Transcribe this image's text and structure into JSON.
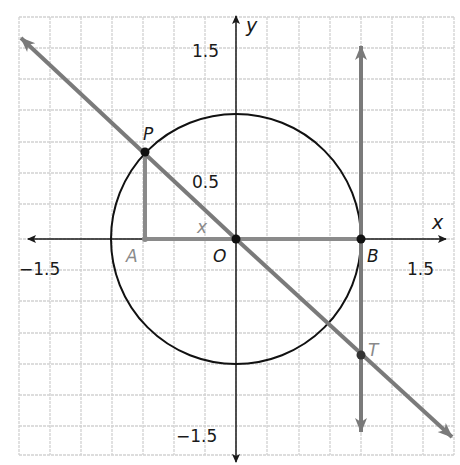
{
  "diagram": {
    "type": "unit-circle-tangent",
    "axes": {
      "x_label": "x",
      "y_label": "y",
      "ticks": {
        "x_neg": "−1.5",
        "x_pos": "1.5",
        "y_pos": "1.5",
        "y_half": "0.5",
        "y_neg": "−1.5"
      }
    },
    "points": {
      "P": "P",
      "A": "A",
      "O": "O",
      "B": "B",
      "T": "T"
    },
    "angle_label": "x",
    "colors": {
      "grid": "#cfcfcf",
      "axis": "#1a1a1a",
      "circle": "#111111",
      "secant_line": "#7a7a7a",
      "tangent_line": "#7a7a7a",
      "segment": "#8a8a8a",
      "point": "#111111"
    }
  }
}
